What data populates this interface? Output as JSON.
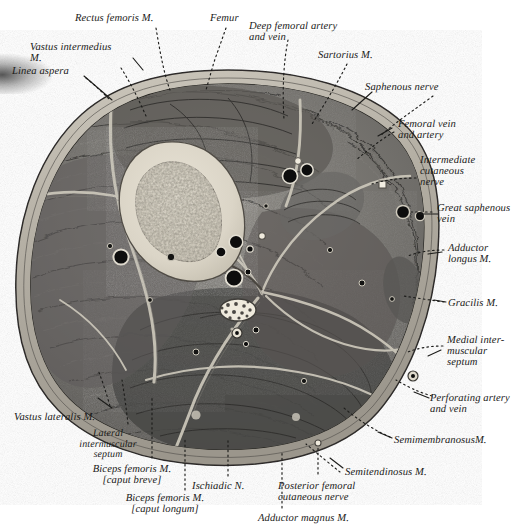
{
  "figure": {
    "type": "anatomical-cross-section",
    "palette": {
      "background": "#ffffff",
      "skin_fascia": "#b9b5ad",
      "subcutaneous": "#a9a59c",
      "muscle_dark": "#4f4e4c",
      "muscle_mid": "#6b6966",
      "muscle_light": "#8d8a85",
      "bone_cortex": "#ded9cd",
      "bone_marrow": "#8e8a80",
      "vessel_black": "#0d0d0d",
      "septum_white": "#d8d4c9",
      "ink": "#1a1a18"
    },
    "labels": [
      {
        "id": "rectus-femoris",
        "lines": [
          "Rectus femoris M."
        ],
        "x": 75,
        "y": 13,
        "align": "left",
        "size": "sz11"
      },
      {
        "id": "femur",
        "lines": [
          "Femur"
        ],
        "x": 210,
        "y": 13,
        "align": "left",
        "size": "sz11"
      },
      {
        "id": "deep-femoral",
        "lines": [
          "Deep femoral artery",
          "and vein"
        ],
        "x": 249,
        "y": 21,
        "align": "left",
        "size": "sz11"
      },
      {
        "id": "vastus-intermedius",
        "lines": [
          "Vastus intermedius",
          "M."
        ],
        "x": 30,
        "y": 42,
        "align": "left",
        "size": "sz11"
      },
      {
        "id": "sartorius",
        "lines": [
          "Sartorius M."
        ],
        "x": 318,
        "y": 50,
        "align": "left",
        "size": "sz11"
      },
      {
        "id": "linea-aspera",
        "lines": [
          "Linea aspera"
        ],
        "x": 12,
        "y": 66,
        "align": "left",
        "size": "sz11"
      },
      {
        "id": "saphenous-nerve",
        "lines": [
          "Saphenous nerve"
        ],
        "x": 365,
        "y": 82,
        "align": "left",
        "size": "sz11"
      },
      {
        "id": "femoral-vein-artery",
        "lines": [
          "Femoral vein",
          "and artery"
        ],
        "x": 398,
        "y": 119,
        "align": "left",
        "size": "sz11"
      },
      {
        "id": "intermediate-cutaneous",
        "lines": [
          "Intermediate",
          "cutaneous",
          "nerve"
        ],
        "x": 420,
        "y": 155,
        "align": "left",
        "size": "sz11"
      },
      {
        "id": "great-saphenous-vein",
        "lines": [
          "Great saphenous",
          "vein"
        ],
        "x": 437,
        "y": 203,
        "align": "left",
        "size": "sz11"
      },
      {
        "id": "adductor-longus",
        "lines": [
          "Adductor",
          "longus M."
        ],
        "x": 448,
        "y": 243,
        "align": "left",
        "size": "sz11"
      },
      {
        "id": "gracilis",
        "lines": [
          "Gracilis M."
        ],
        "x": 448,
        "y": 298,
        "align": "left",
        "size": "sz11"
      },
      {
        "id": "medial-septum",
        "lines": [
          "Medial inter-",
          "muscular",
          "septum"
        ],
        "x": 447,
        "y": 335,
        "align": "left",
        "size": "sz11"
      },
      {
        "id": "perforating-artery",
        "lines": [
          "Perforating artery",
          "and vein"
        ],
        "x": 430,
        "y": 393,
        "align": "left",
        "size": "sz11"
      },
      {
        "id": "semimembranosus",
        "lines": [
          "SemimembranosusM."
        ],
        "x": 394,
        "y": 435,
        "align": "left",
        "size": "sz11"
      },
      {
        "id": "vastus-lateralis",
        "lines": [
          "Vastus lateralis M."
        ],
        "x": 14,
        "y": 412,
        "align": "left",
        "size": "sz11"
      },
      {
        "id": "lateral-septum",
        "lines": [
          "Lateral",
          "intermuscular",
          "septum"
        ],
        "x": 108,
        "y": 429,
        "align": "center",
        "size": "sz10"
      },
      {
        "id": "biceps-femoris-breve",
        "lines": [
          "Biceps femoris M.",
          "[caput breve]"
        ],
        "x": 132,
        "y": 464,
        "align": "center",
        "size": "sz11"
      },
      {
        "id": "ischiadic-nerve",
        "lines": [
          "Ischiadic N."
        ],
        "x": 192,
        "y": 481,
        "align": "left",
        "size": "sz11"
      },
      {
        "id": "semitendinosus",
        "lines": [
          "Semitendinosus M."
        ],
        "x": 345,
        "y": 467,
        "align": "left",
        "size": "sz11"
      },
      {
        "id": "posterior-femoral",
        "lines": [
          "Posterior femoral",
          "cutaneous nerve"
        ],
        "x": 278,
        "y": 481,
        "align": "left",
        "size": "sz11"
      },
      {
        "id": "biceps-femoris-longum",
        "lines": [
          "Biceps femoris M.",
          "[caput longum]"
        ],
        "x": 165,
        "y": 493,
        "align": "center",
        "size": "sz11"
      },
      {
        "id": "adductor-magnus",
        "lines": [
          "Adductor magnus M."
        ],
        "x": 258,
        "y": 513,
        "align": "left",
        "size": "sz11"
      }
    ],
    "structures": [
      {
        "id": "femur",
        "kind": "bone",
        "note": "cortical shaft with medullary cavity"
      },
      {
        "id": "femoral-vein",
        "kind": "vessel",
        "note": "large dark circle"
      },
      {
        "id": "femoral-artery",
        "kind": "vessel",
        "note": "dark circle"
      },
      {
        "id": "deep-femoral-vessels",
        "kind": "vessel",
        "note": "paired dark circles"
      },
      {
        "id": "great-saphenous-vein",
        "kind": "vessel",
        "note": "two dark circles in subcutaneous fat"
      },
      {
        "id": "ischiadic-nerve",
        "kind": "nerve",
        "note": "stippled oval fascicles"
      },
      {
        "id": "perforating-vessels",
        "kind": "vessel",
        "note": "small ringed dot"
      }
    ]
  }
}
